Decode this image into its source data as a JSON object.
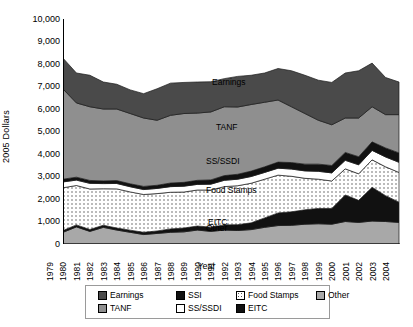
{
  "chart_data": {
    "type": "area",
    "stacked": true,
    "title": "",
    "xlabel": "Year",
    "ylabel": "2005 Dollars",
    "xlim": [
      1979,
      2004
    ],
    "ylim": [
      0,
      10000
    ],
    "ytick_step": 1000,
    "grid": false,
    "legend_position": "bottom",
    "categories": [
      1979,
      1980,
      1981,
      1982,
      1983,
      1984,
      1985,
      1986,
      1987,
      1988,
      1989,
      1990,
      1991,
      1992,
      1993,
      1994,
      1995,
      1996,
      1997,
      1998,
      1999,
      2000,
      2001,
      2002,
      2003,
      2004
    ],
    "tick_labels": [
      "1979",
      "1980",
      "1981",
      "1982",
      "1983",
      "1984",
      "1985",
      "1986",
      "1987",
      "1988",
      "1989",
      "1990",
      "1991",
      "1992",
      "1993",
      "1994",
      "1995",
      "1996",
      "1997",
      "1998",
      "1999",
      "2000",
      "2001",
      "2002",
      "2003",
      "2004"
    ],
    "ytick_labels": [
      "10,000",
      "9,000",
      "8,000",
      "7,000",
      "6,000",
      "5,000",
      "4,000",
      "3,000",
      "2,000",
      "1,000",
      "0"
    ],
    "ytick_values": [
      10000,
      9000,
      8000,
      7000,
      6000,
      5000,
      4000,
      3000,
      2000,
      1000,
      0
    ],
    "stack_order": [
      "Other",
      "EITC",
      "Food Stamps",
      "SS/SSDI",
      "SSI",
      "TANF",
      "Earnings"
    ],
    "series": [
      {
        "name": "Other",
        "color": "#a8a8a8",
        "pattern": "solid",
        "values": [
          520,
          760,
          560,
          740,
          620,
          520,
          420,
          470,
          520,
          540,
          620,
          560,
          620,
          600,
          640,
          740,
          820,
          830,
          880,
          900,
          880,
          1000,
          960,
          1020,
          1000,
          960
        ]
      },
      {
        "name": "EITC",
        "color": "#111111",
        "pattern": "solid",
        "values": [
          80,
          90,
          85,
          95,
          90,
          95,
          100,
          110,
          150,
          170,
          180,
          190,
          230,
          260,
          300,
          420,
          560,
          600,
          640,
          680,
          700,
          1180,
          980,
          1500,
          1150,
          900
        ]
      },
      {
        "name": "Food Stamps",
        "color": "#f0f0f0",
        "pattern": "dots",
        "values": [
          1900,
          1750,
          1800,
          1620,
          1740,
          1700,
          1680,
          1660,
          1630,
          1600,
          1600,
          1650,
          1700,
          1730,
          1760,
          1720,
          1680,
          1580,
          1400,
          1300,
          1220,
          1160,
          1180,
          1220,
          1280,
          1320
        ]
      },
      {
        "name": "SS/SSDI",
        "color": "#ffffff",
        "pattern": "solid",
        "values": [
          260,
          240,
          250,
          230,
          240,
          230,
          220,
          230,
          250,
          260,
          250,
          260,
          280,
          290,
          300,
          300,
          310,
          320,
          330,
          350,
          360,
          380,
          400,
          420,
          440,
          450
        ]
      },
      {
        "name": "SSI",
        "color": "#111111",
        "pattern": "solid",
        "values": [
          120,
          130,
          130,
          120,
          130,
          130,
          140,
          140,
          160,
          170,
          180,
          190,
          210,
          220,
          240,
          250,
          270,
          290,
          300,
          320,
          330,
          350,
          360,
          380,
          400,
          420
        ]
      },
      {
        "name": "TANF",
        "color": "#8f8f8f",
        "pattern": "solid",
        "values": [
          4010,
          3300,
          3275,
          3195,
          3180,
          3125,
          3040,
          2890,
          3010,
          3060,
          2990,
          3020,
          3060,
          2990,
          2960,
          2870,
          2760,
          2480,
          2250,
          1950,
          1810,
          1530,
          1720,
          1560,
          1480,
          1700
        ]
      },
      {
        "name": "Earnings",
        "color": "#4a4a4a",
        "pattern": "solid",
        "values": [
          1370,
          1330,
          1400,
          1200,
          1100,
          1050,
          1080,
          1400,
          1430,
          1380,
          1380,
          1340,
          1250,
          1360,
          1300,
          1300,
          1400,
          1600,
          1700,
          1780,
          1880,
          2000,
          2100,
          1940,
          1650,
          1450
        ]
      }
    ],
    "inline_labels": [
      {
        "text": "Earnings",
        "x": 212,
        "y": 78
      },
      {
        "text": "TANF",
        "x": 216,
        "y": 123
      },
      {
        "text": "SS/SSDI",
        "x": 206,
        "y": 157
      },
      {
        "text": "Food Stamps",
        "x": 206,
        "y": 186
      },
      {
        "text": "EITC",
        "x": 208,
        "y": 218
      },
      {
        "text": "Other",
        "x": 206,
        "y": 224
      }
    ]
  },
  "legend": {
    "rows": [
      [
        {
          "label": "Earnings",
          "swatch": "#4a4a4a",
          "pattern": "solid"
        },
        {
          "label": "SSI",
          "swatch": "#111111",
          "pattern": "solid"
        },
        {
          "label": "Food Stamps",
          "swatch": "#f0f0f0",
          "pattern": "dots"
        },
        {
          "label": "Other",
          "swatch": "#a8a8a8",
          "pattern": "solid"
        }
      ],
      [
        {
          "label": "TANF",
          "swatch": "#8f8f8f",
          "pattern": "solid"
        },
        {
          "label": "SS/SSDI",
          "swatch": "#ffffff",
          "pattern": "solid"
        },
        {
          "label": "EITC",
          "swatch": "#111111",
          "pattern": "solid"
        }
      ]
    ],
    "column_offsets": [
      0,
      78,
      138,
      218
    ]
  }
}
